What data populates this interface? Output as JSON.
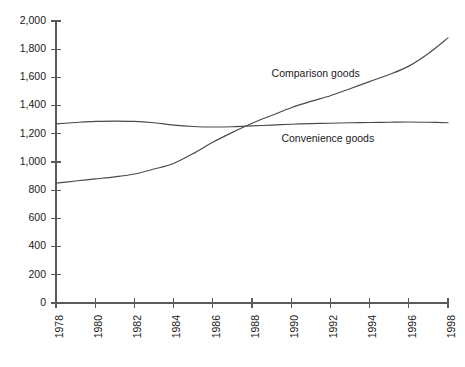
{
  "chart_data": {
    "type": "line",
    "title": "",
    "subtitle": "",
    "xlabel": "",
    "ylabel": "",
    "grid": false,
    "legend_position": "inline-annotation",
    "xlim": [
      1978,
      1998
    ],
    "ylim": [
      0,
      2000
    ],
    "x_tick_labels": [
      "1978",
      "1980",
      "1982",
      "1984",
      "1986",
      "1988",
      "1990",
      "1992",
      "1994",
      "1996",
      "1998"
    ],
    "x_ticks": [
      1978,
      1980,
      1982,
      1984,
      1986,
      1988,
      1990,
      1992,
      1994,
      1996,
      1998
    ],
    "y_tick_labels": [
      "0",
      "200",
      "400",
      "600",
      "800",
      "1,000",
      "1,200",
      "1,400",
      "1,600",
      "1,800",
      "2,000"
    ],
    "y_ticks": [
      0,
      200,
      400,
      600,
      800,
      1000,
      1200,
      1400,
      1600,
      1800,
      2000
    ],
    "x": [
      1978,
      1979,
      1980,
      1981,
      1982,
      1983,
      1984,
      1985,
      1986,
      1987,
      1988,
      1989,
      1990,
      1991,
      1992,
      1993,
      1994,
      1995,
      1996,
      1997,
      1998
    ],
    "series": [
      {
        "name": "Comparison goods",
        "label": "Comparison goods",
        "color": "#4a4a4a",
        "label_x": 1989.0,
        "label_y": 1620,
        "values": [
          850,
          865,
          880,
          895,
          915,
          950,
          990,
          1060,
          1140,
          1210,
          1275,
          1330,
          1385,
          1430,
          1470,
          1520,
          1570,
          1620,
          1680,
          1770,
          1880
        ]
      },
      {
        "name": "Convenience goods",
        "label": "Convenience goods",
        "color": "#4a4a4a",
        "label_x": 1989.5,
        "label_y": 1165,
        "values": [
          1270,
          1280,
          1288,
          1290,
          1288,
          1278,
          1262,
          1252,
          1248,
          1250,
          1256,
          1262,
          1268,
          1272,
          1275,
          1278,
          1280,
          1282,
          1284,
          1282,
          1278
        ]
      }
    ]
  },
  "axis": {
    "y_axis_name": "value-axis",
    "x_axis_name": "year-axis"
  }
}
